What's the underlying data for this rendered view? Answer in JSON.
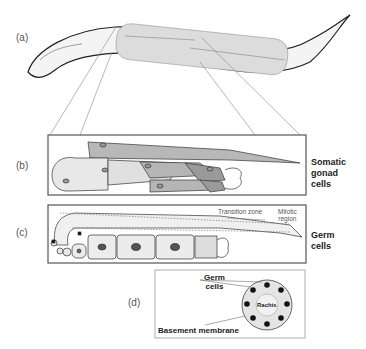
{
  "figure": {
    "panels": [
      {
        "id": "a",
        "label": "(a)"
      },
      {
        "id": "b",
        "label": "(b)",
        "caption": [
          "Somatic",
          "gonad",
          "cells"
        ]
      },
      {
        "id": "c",
        "label": "(c)",
        "caption": [
          "Germ",
          "cells"
        ],
        "annotations": {
          "transition_zone": "Transition zone",
          "mitotic_region": [
            "Mitotic",
            "region"
          ]
        }
      },
      {
        "id": "d",
        "label": "(d)",
        "annotations": {
          "germ_cells": [
            "Germ",
            "cells"
          ],
          "rachis": "Rachis",
          "basement_membrane": "Basement membrane"
        }
      }
    ],
    "colors": {
      "outline": "#222222",
      "panel_border": "#555555",
      "light_fill": "#e6e6e6",
      "mid_fill": "#b5b5b5",
      "dark_fill": "#9a9a9a"
    }
  }
}
